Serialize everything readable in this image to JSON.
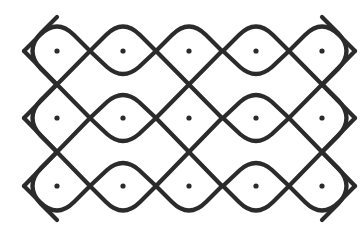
{
  "diagram": {
    "type": "kolam",
    "grid": {
      "columns": 5,
      "rows": 3
    },
    "dots": [
      {
        "x": 57,
        "y": 51
      },
      {
        "x": 123,
        "y": 51
      },
      {
        "x": 189,
        "y": 51
      },
      {
        "x": 256,
        "y": 51
      },
      {
        "x": 322,
        "y": 51
      },
      {
        "x": 57,
        "y": 118
      },
      {
        "x": 123,
        "y": 118
      },
      {
        "x": 189,
        "y": 118
      },
      {
        "x": 256,
        "y": 118
      },
      {
        "x": 322,
        "y": 118
      },
      {
        "x": 57,
        "y": 186
      },
      {
        "x": 123,
        "y": 186
      },
      {
        "x": 189,
        "y": 186
      },
      {
        "x": 256,
        "y": 186
      },
      {
        "x": 322,
        "y": 186
      }
    ],
    "colors": {
      "stroke": "#2b2b2b",
      "background": "#ffffff"
    }
  }
}
